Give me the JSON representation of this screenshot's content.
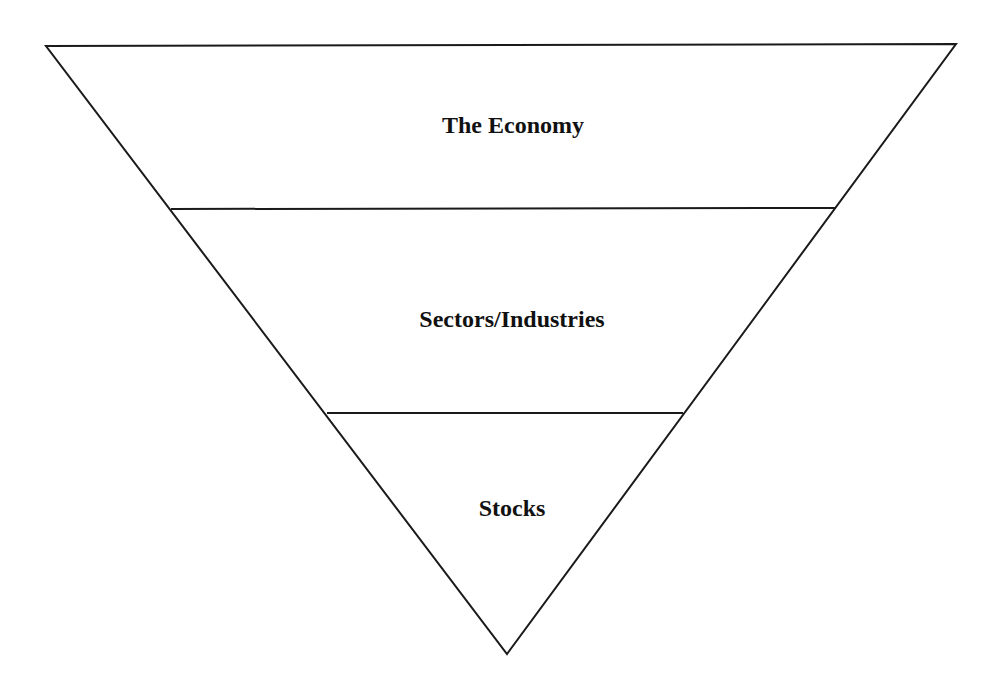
{
  "diagram": {
    "type": "inverted-pyramid",
    "stroke_color": "#1a1a1a",
    "background": "#ffffff",
    "triangle": {
      "top_left": [
        46,
        46
      ],
      "top_right": [
        956,
        44
      ],
      "apex": [
        507,
        654
      ]
    },
    "tiers": [
      {
        "label": "The Economy",
        "label_pos": [
          513,
          127
        ],
        "divider_below": {
          "x1": 171,
          "y1": 209,
          "x2": 836,
          "y2": 208
        }
      },
      {
        "label": "Sectors/Industries",
        "label_pos": [
          512,
          321
        ],
        "divider_below": {
          "x1": 327,
          "y1": 413,
          "x2": 683,
          "y2": 413
        }
      },
      {
        "label": "Stocks",
        "label_pos": [
          512,
          510
        ],
        "divider_below": null
      }
    ]
  }
}
